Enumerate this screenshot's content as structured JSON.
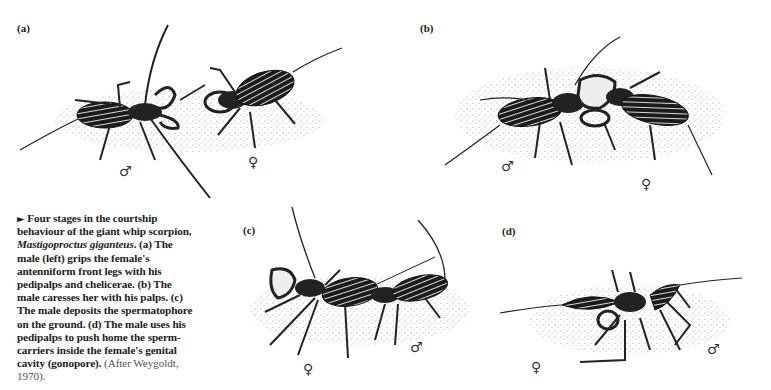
{
  "figure": {
    "panels": [
      {
        "id": "a",
        "label": "(a)",
        "symbols": {
          "male": "♂",
          "female": "♀"
        }
      },
      {
        "id": "b",
        "label": "(b)",
        "symbols": {
          "male": "♂",
          "female": "♀"
        }
      },
      {
        "id": "c",
        "label": "(c)",
        "symbols": {
          "male": "♂",
          "female": "♀"
        }
      },
      {
        "id": "d",
        "label": "(d)",
        "symbols": {
          "male": "♂",
          "female": "♀"
        }
      }
    ],
    "caption": {
      "marker": "►",
      "lead": "Four stages in the courtship behaviour of the giant whip scorpion,",
      "species": "Mastigoproctus giganteus",
      "body": ". (a) The male (left) grips the female's antenniform front legs with his pedipalps and chelicerae. (b) The male caresses her with his palps. (c) The male deposits the spermatophore on the ground. (d) The male uses his pedipalps to push home the sperm-carriers inside the female's genital cavity (gonopore).",
      "source": "(After Weygoldt, 1970)."
    }
  }
}
